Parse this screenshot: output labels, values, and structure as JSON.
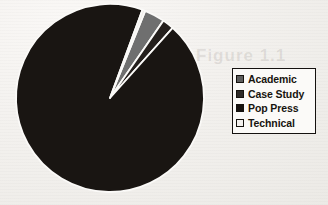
{
  "background_color": "#f4f2ef",
  "ghost_artifact": {
    "text": "Figure 1.1"
  },
  "legend": {
    "border_color": "#14110f",
    "background_color": "#fbfaf8",
    "items": [
      {
        "label": "Academic",
        "color": "#5e5e5e",
        "swatch_name": "legend-swatch-academic"
      },
      {
        "label": "Case Study",
        "color": "#2e2b28",
        "swatch_name": "legend-swatch-case-study"
      },
      {
        "label": "Pop Press",
        "color": "#171310",
        "swatch_name": "legend-swatch-pop-press"
      },
      {
        "label": "Technical",
        "color": "#f3f1ee",
        "swatch_name": "legend-swatch-technical"
      }
    ]
  },
  "chart_data": {
    "type": "pie",
    "title": "",
    "categories": [
      "Academic",
      "Case Study",
      "Pop Press",
      "Technical"
    ],
    "values": [
      3.5,
      2.0,
      94.0,
      0.5
    ],
    "unit": "percent",
    "colors": [
      "#6f6f6f",
      "#241f1c",
      "#191512",
      "#efece8"
    ],
    "slice_separator_color": "#fbfaf8",
    "legend_position": "right",
    "center": [
      110,
      98
    ],
    "radius": 94,
    "start_angle_deg": -68,
    "direction": "clockwise",
    "labels_shown": false,
    "grid": false
  }
}
